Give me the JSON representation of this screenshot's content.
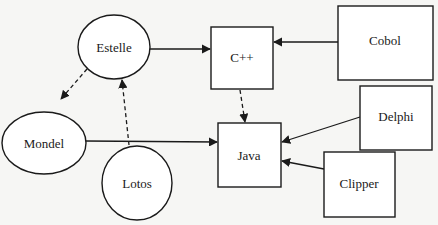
{
  "diagram": {
    "type": "dependency-graph",
    "nodes": [
      {
        "id": "estelle",
        "label": "Estelle",
        "shape": "ellipse"
      },
      {
        "id": "cpp",
        "label": "C++",
        "shape": "box"
      },
      {
        "id": "cobol",
        "label": "Cobol",
        "shape": "box"
      },
      {
        "id": "mondel",
        "label": "Mondel",
        "shape": "ellipse"
      },
      {
        "id": "java",
        "label": "Java",
        "shape": "box"
      },
      {
        "id": "delphi",
        "label": "Delphi",
        "shape": "box"
      },
      {
        "id": "lotos",
        "label": "Lotos",
        "shape": "ellipse"
      },
      {
        "id": "clipper",
        "label": "Clipper",
        "shape": "box"
      }
    ],
    "edges": [
      {
        "from": "estelle",
        "to": "cpp",
        "style": "solid"
      },
      {
        "from": "cobol",
        "to": "cpp",
        "style": "solid"
      },
      {
        "from": "estelle",
        "to": "mondel",
        "style": "dashed"
      },
      {
        "from": "lotos",
        "to": "estelle",
        "style": "dashed"
      },
      {
        "from": "cpp",
        "to": "java",
        "style": "dashed"
      },
      {
        "from": "mondel",
        "to": "java",
        "style": "solid"
      },
      {
        "from": "delphi",
        "to": "java",
        "style": "solid"
      },
      {
        "from": "clipper",
        "to": "java",
        "style": "solid"
      }
    ]
  },
  "colors": {
    "background": "#f6f6f4",
    "stroke": "#1a1a1a",
    "fill": "#ffffff"
  }
}
